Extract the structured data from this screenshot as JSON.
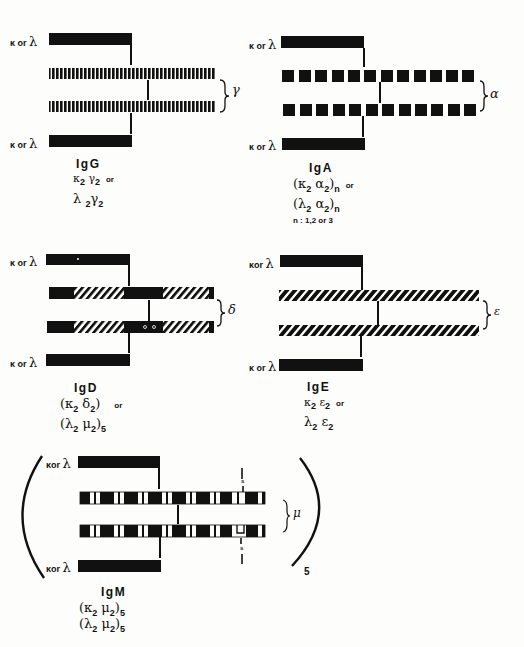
{
  "diagram": {
    "light_chain_label": "κ or λ",
    "panels": [
      {
        "id": "igg",
        "title": "IgG",
        "heavy_chain_symbol": "γ",
        "heavy_chain_pattern": "fine-vertical-stripes",
        "formula_lines": [
          {
            "text": "κ₂γ₂",
            "suffix": "or"
          },
          {
            "text": "λ₂γ₂",
            "suffix": ""
          }
        ]
      },
      {
        "id": "iga",
        "title": "IgA",
        "heavy_chain_symbol": "α",
        "heavy_chain_pattern": "square-blocks",
        "formula_lines": [
          {
            "text": "(κ₂ α₂)ₙ",
            "suffix": "or"
          },
          {
            "text": "(λ₂ α₂)ₙ",
            "suffix": ""
          }
        ],
        "note": "n = 1,2 or 3"
      },
      {
        "id": "igd",
        "title": "IgD",
        "heavy_chain_symbol": "δ",
        "heavy_chain_pattern": "solid-with-hatched-segments",
        "formula_lines": [
          {
            "text": "(κ₂ δ₂)",
            "suffix": "or"
          },
          {
            "text": "(λ₂ μ₂)₅",
            "suffix": ""
          }
        ]
      },
      {
        "id": "ige",
        "title": "IgE",
        "heavy_chain_symbol": "ε",
        "heavy_chain_pattern": "diagonal-hatching",
        "formula_lines": [
          {
            "text": "κ₂ ε₂",
            "suffix": "or"
          },
          {
            "text": "λ₂ ε₂",
            "suffix": ""
          }
        ]
      },
      {
        "id": "igm",
        "title": "IgM",
        "heavy_chain_symbol": "μ",
        "heavy_chain_pattern": "blocks-with-bars",
        "pentamer_subscript": "5",
        "disulfide_label": "s",
        "formula_lines": [
          {
            "text": "(κ₂μ₂)₅",
            "suffix": ""
          },
          {
            "text": "(λ₂μ₂)₅",
            "suffix": ""
          }
        ]
      }
    ]
  },
  "labels": {
    "kappa": "κ",
    "or": "or",
    "lambda": "λ",
    "igg": {
      "title": "IgG",
      "f1a": "κ",
      "f1b": "2",
      "f1c": "γ",
      "f1d": "2",
      "f1or": "or",
      "f2a": "λ",
      "f2b": "2",
      "f2c": "γ",
      "f2d": "2",
      "sym": "γ"
    },
    "iga": {
      "title": "IgA",
      "f1a": "(κ",
      "f1b": "2",
      "f1c": " α",
      "f1d": "2",
      "f1e": ")",
      "f1n": "n",
      "f1or": "or",
      "f2a": "(λ",
      "f2b": "2",
      "f2c": " α",
      "f2d": "2",
      "f2e": ")",
      "f2n": "n",
      "note": "n : 1,2 or 3",
      "sym": "α"
    },
    "igd": {
      "title": "IgD",
      "f1a": "(κ",
      "f1b": "2",
      "f1c": " δ",
      "f1d": "2",
      "f1e": ")",
      "f1or": "or",
      "f2a": "(λ",
      "f2b": "2",
      "f2c": " μ",
      "f2d": "2",
      "f2e": ")",
      "f2n": "5",
      "sym": "δ"
    },
    "ige": {
      "title": "IgE",
      "f1a": "κ",
      "f1b": "2",
      "f1c": " ε",
      "f1d": "2",
      "f1or": "or",
      "f2a": "λ",
      "f2b": "2",
      "f2c": " ε",
      "f2d": "2",
      "sym": "ε"
    },
    "igm": {
      "title": "IgM",
      "f1a": "(κ",
      "f1b": "2",
      "f1c": " μ",
      "f1d": "2",
      "f1e": ")",
      "f1n": "5",
      "f2a": "(λ",
      "f2b": "2",
      "f2c": " μ",
      "f2d": "2",
      "f2e": ")",
      "f2n": "5",
      "sym": "μ",
      "pent": "5",
      "s": "s"
    }
  },
  "colors": {
    "ink": "#111111",
    "paper": "#fdfdfb"
  }
}
